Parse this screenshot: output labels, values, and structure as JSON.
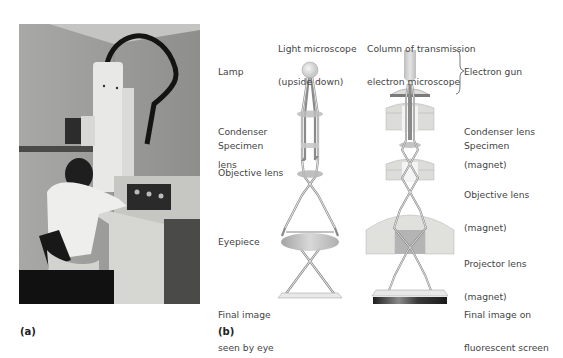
{
  "panels": {
    "a": {
      "label": "(a)"
    },
    "b": {
      "label": "(b)"
    }
  },
  "photo": {
    "description": "Technician operating a transmission electron microscope"
  },
  "light_microscope": {
    "title_line1": "Light microscope",
    "title_line2": "(upside down)",
    "labels": {
      "lamp": "Lamp",
      "condenser_1": "Condenser",
      "condenser_2": "lens",
      "specimen": "Specimen",
      "objective": "Objective lens",
      "eyepiece": "Eyepiece",
      "final_1": "Final image",
      "final_2": "seen by eye"
    }
  },
  "electron_microscope": {
    "title_line1": "Column of transmission",
    "title_line2": "electron microscope",
    "labels": {
      "gun": "Electron gun",
      "condenser_1": "Condenser lens",
      "condenser_2": "(magnet)",
      "specimen": "Specimen",
      "objective_1": "Objective lens",
      "objective_2": "(magnet)",
      "projector_1": "Projector lens",
      "projector_2": "(magnet)",
      "final_1": "Final image on",
      "final_2": "fluorescent screen"
    }
  },
  "colors": {
    "lens_fill": "#bdbdbd",
    "magnet_fill": "#dcdcd8",
    "ray": "#8a8a8a",
    "screen": "#2a2a2a"
  }
}
